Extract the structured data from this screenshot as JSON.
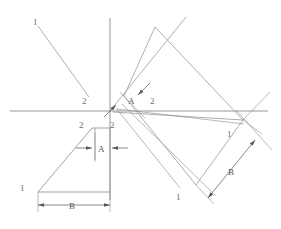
{
  "figure": {
    "background_color": "#ffffff",
    "line_color": "#8a8a8a",
    "axis_color": "#8a8a8a",
    "dim_color": "#555555",
    "label_color": "#6f6f6f",
    "width": 281,
    "height": 229
  },
  "axes": {
    "origin": {
      "x": 110,
      "y": 111
    },
    "vertical": {
      "x": 110,
      "y_top": 18,
      "y_bottom": 200
    },
    "horizontal": {
      "y": 111,
      "x_left": 10,
      "x_right": 268
    }
  },
  "labels": {
    "vertex_1": "1",
    "vertex_2": "2",
    "dim_a": "A",
    "dim_b": "B"
  },
  "annotations": [
    {
      "name": "origin-ray-label-1",
      "text": "1",
      "x": 33,
      "y": 22
    },
    {
      "name": "origin-ray-label-2",
      "text": "2",
      "x": 82,
      "y": 101
    },
    {
      "name": "original-profile-label-2",
      "text": "2",
      "x": 79,
      "y": 125
    },
    {
      "name": "original-profile-label-1",
      "text": "1",
      "x": 20,
      "y": 188
    },
    {
      "name": "original-dim-a-label",
      "text": "A",
      "x": 97,
      "y": 152
    },
    {
      "name": "original-dim-b-label",
      "text": "B",
      "x": 69,
      "y": 209
    },
    {
      "name": "rotated-profile-label-2-inner",
      "text": "2",
      "x": 112,
      "y": 124
    },
    {
      "name": "rotated-profile-label-2-outer",
      "text": "2",
      "x": 151,
      "y": 102
    },
    {
      "name": "rotated-dim-a-label",
      "text": "A",
      "x": 131,
      "y": 102
    },
    {
      "name": "rotated-profile-label-1-lower",
      "text": "1",
      "x": 177,
      "y": 197
    },
    {
      "name": "rotated-profile-label-1-right",
      "text": "1",
      "x": 228,
      "y": 134
    },
    {
      "name": "rotated-dim-b-label",
      "text": "B",
      "x": 230,
      "y": 172
    }
  ],
  "shapes": {
    "origin_ray": {
      "from": [
        38,
        26
      ],
      "to": [
        89,
        97
      ]
    },
    "original_profile": {
      "triangle_hyp": {
        "from": [
          38,
          192
        ],
        "to": [
          92,
          128
        ]
      },
      "top_edge": {
        "from": [
          92,
          128
        ],
        "to": [
          110,
          128
        ]
      },
      "right_edge": {
        "from": [
          110,
          128
        ],
        "to": [
          110,
          192
        ]
      },
      "base": {
        "from": [
          38,
          192
        ],
        "to": [
          110,
          192
        ]
      }
    },
    "rotated_profile": {
      "hyp": {
        "from": [
          243,
          120
        ],
        "to": [
          155,
          27
        ]
      },
      "edge_1": {
        "from": [
          155,
          27
        ],
        "to": [
          124,
          96
        ]
      },
      "edge_2": {
        "from": [
          124,
          96
        ],
        "to": [
          196,
          185
        ]
      },
      "edge_3": {
        "from": [
          196,
          185
        ],
        "to": [
          243,
          120
        ]
      }
    },
    "rotated_inner": {
      "line_1": {
        "from": [
          116,
          110
        ],
        "to": [
          186,
          17
        ]
      },
      "line_2": {
        "from": [
          113,
          113
        ],
        "to": [
          178,
          190
        ]
      }
    },
    "dim_a_original": {
      "y": 148,
      "x_from": 93,
      "x_to": 110
    },
    "dim_b_original": {
      "y": 205,
      "x_from": 38,
      "x_to": 110
    },
    "dim_b_rotated": {
      "from": [
        255,
        140
      ],
      "to": [
        208,
        198
      ]
    }
  }
}
